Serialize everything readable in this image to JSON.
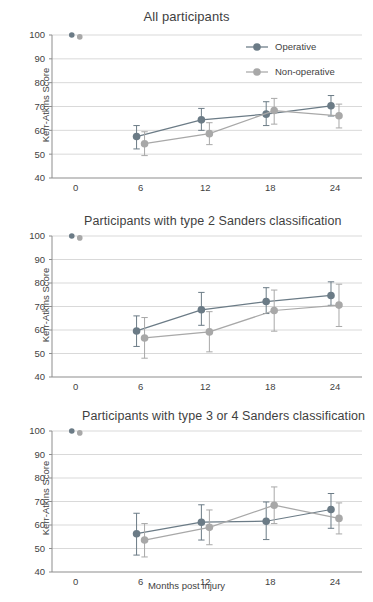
{
  "figure": {
    "xlabel": "Months post injury",
    "ylabel": "Kerr-Atkins Score",
    "series_names": [
      "Operative",
      "Non-operative"
    ],
    "colors": {
      "operative": "#6b7b86",
      "non_operative": "#a8a8a8",
      "grid": "#c9c9c9",
      "axis": "#8d8d8d",
      "text": "#3f3f3f"
    }
  },
  "legend": {
    "position": "top-right of panel 1",
    "items": [
      {
        "label": "Operative",
        "color": "#6b7b86"
      },
      {
        "label": "Non-operative",
        "color": "#a8a8a8"
      }
    ]
  },
  "chart_data": [
    {
      "type": "line",
      "title": "All participants",
      "xlabel": "",
      "ylabel": "Kerr-Atkins Score",
      "x": [
        0,
        6,
        12,
        18,
        24
      ],
      "xticklabels": [
        "0",
        "6",
        "12",
        "18",
        "24"
      ],
      "yticklabels": [
        "40",
        "50",
        "60",
        "70",
        "80",
        "90",
        "100"
      ],
      "ylim": [
        40,
        100
      ],
      "xlim": [
        -2.2,
        26.5
      ],
      "grid": true,
      "legend": true,
      "series": [
        {
          "name": "Operative",
          "color": "#6b7b86",
          "x": [
            0,
            6,
            12,
            18,
            24
          ],
          "values": [
            100.0,
            57.4,
            64.4,
            66.8,
            70.3
          ],
          "err_low": [
            null,
            52.2,
            60.0,
            62.0,
            66.0
          ],
          "err_high": [
            null,
            62.0,
            69.2,
            72.0,
            74.6
          ],
          "connected_from_index": 1
        },
        {
          "name": "Non-operative",
          "color": "#a8a8a8",
          "x": [
            0,
            6,
            12,
            18,
            24
          ],
          "values": [
            99.2,
            54.4,
            58.6,
            68.3,
            66.1
          ],
          "err_low": [
            null,
            49.4,
            54.0,
            62.6,
            61.0
          ],
          "err_high": [
            null,
            59.4,
            63.2,
            73.4,
            71.0
          ],
          "connected_from_index": 1
        }
      ]
    },
    {
      "type": "line",
      "title": "Participants with type 2 Sanders classification",
      "xlabel": "",
      "ylabel": "Kerr-Atkins Score",
      "x": [
        0,
        6,
        12,
        18,
        24
      ],
      "xticklabels": [
        "0",
        "6",
        "12",
        "18",
        "24"
      ],
      "yticklabels": [
        "40",
        "50",
        "60",
        "70",
        "80",
        "90",
        "100"
      ],
      "ylim": [
        40,
        100
      ],
      "xlim": [
        -2.2,
        26.5
      ],
      "grid": true,
      "legend": false,
      "series": [
        {
          "name": "Operative",
          "color": "#6b7b86",
          "x": [
            0,
            6,
            12,
            18,
            24
          ],
          "values": [
            100.0,
            59.6,
            68.6,
            72.1,
            74.7
          ],
          "err_low": [
            null,
            53.0,
            62.0,
            67.0,
            70.5
          ],
          "err_high": [
            null,
            66.0,
            76.0,
            78.0,
            80.5
          ],
          "connected_from_index": 1
        },
        {
          "name": "Non-operative",
          "color": "#a8a8a8",
          "x": [
            0,
            6,
            12,
            18,
            24
          ],
          "values": [
            99.2,
            56.6,
            59.2,
            68.3,
            70.6
          ],
          "err_low": [
            null,
            48.0,
            50.7,
            59.5,
            61.5
          ],
          "err_high": [
            null,
            65.3,
            67.8,
            77.0,
            79.5
          ],
          "connected_from_index": 1
        }
      ]
    },
    {
      "type": "line",
      "title": "Participants with type 3 or 4 Sanders classification",
      "xlabel": "Months post injury",
      "ylabel": "Kerr-Atkins Score",
      "x": [
        0,
        6,
        12,
        18,
        24
      ],
      "xticklabels": [
        "0",
        "6",
        "12",
        "18",
        "24"
      ],
      "yticklabels": [
        "40",
        "50",
        "60",
        "70",
        "80",
        "90",
        "100"
      ],
      "ylim": [
        40,
        100
      ],
      "xlim": [
        -2.2,
        26.5
      ],
      "grid": true,
      "legend": false,
      "series": [
        {
          "name": "Operative",
          "color": "#6b7b86",
          "x": [
            0,
            6,
            12,
            18,
            24
          ],
          "values": [
            100.0,
            56.3,
            61.2,
            61.6,
            66.6
          ],
          "err_low": [
            null,
            47.2,
            53.6,
            53.8,
            58.6
          ],
          "err_high": [
            null,
            65.0,
            68.6,
            69.8,
            73.4
          ],
          "connected_from_index": 1
        },
        {
          "name": "Non-operative",
          "color": "#a8a8a8",
          "x": [
            0,
            6,
            12,
            18,
            24
          ],
          "values": [
            99.2,
            53.6,
            59.0,
            68.4,
            62.8
          ],
          "err_low": [
            null,
            46.4,
            51.6,
            60.6,
            56.2
          ],
          "err_high": [
            null,
            60.6,
            66.4,
            76.2,
            69.4
          ],
          "connected_from_index": 1
        }
      ]
    }
  ]
}
